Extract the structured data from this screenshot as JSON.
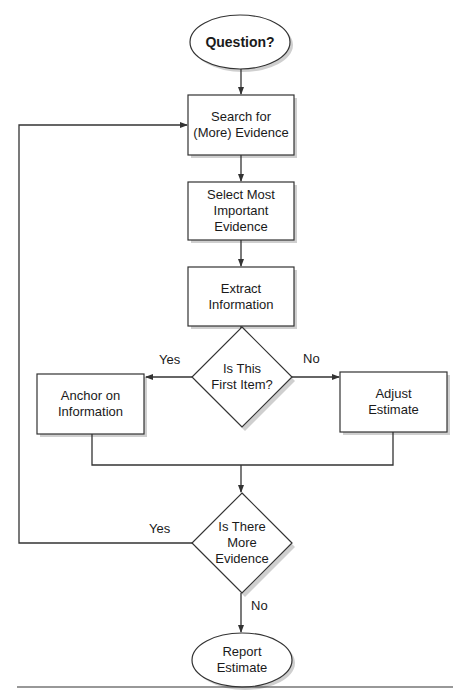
{
  "diagram": {
    "type": "flowchart",
    "nodes": {
      "start": {
        "shape": "oval",
        "text": "Question?"
      },
      "search": {
        "shape": "rect",
        "line1": "Search for",
        "line2": "(More) Evidence"
      },
      "select": {
        "shape": "rect",
        "line1": "Select Most",
        "line2": "Important",
        "line3": "Evidence"
      },
      "extract": {
        "shape": "rect",
        "line1": "Extract",
        "line2": "Information"
      },
      "first_item": {
        "shape": "diamond",
        "line1": "Is This",
        "line2": "First Item?"
      },
      "anchor": {
        "shape": "rect",
        "line1": "Anchor on",
        "line2": "Information"
      },
      "adjust": {
        "shape": "rect",
        "line1": "Adjust",
        "line2": "Estimate"
      },
      "more_evidence": {
        "shape": "diamond",
        "line1": "Is There",
        "line2": "More",
        "line3": "Evidence"
      },
      "report": {
        "shape": "oval",
        "line1": "Report",
        "line2": "Estimate"
      }
    },
    "edge_labels": {
      "first_yes": "Yes",
      "first_no": "No",
      "more_yes": "Yes",
      "more_no": "No"
    },
    "colors": {
      "stroke": "#333333",
      "shadow": "#c8c8c8",
      "fill": "#ffffff"
    }
  }
}
